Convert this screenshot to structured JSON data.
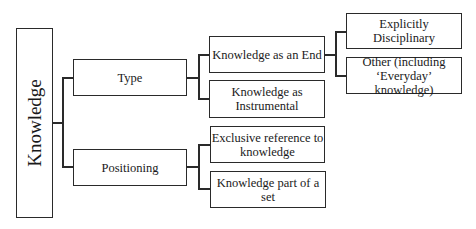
{
  "diagram": {
    "root": {
      "label": "Knowledge"
    },
    "level1": [
      {
        "label": "Type"
      },
      {
        "label": "Positioning"
      }
    ],
    "level2": [
      {
        "label": "Knowledge as an End",
        "parent": "Type"
      },
      {
        "label": "Knowledge as Instrumental",
        "line1": "Knowledge as",
        "line2": "Instrumental",
        "parent": "Type"
      },
      {
        "label": "Exclusive reference to knowledge",
        "line1": "Exclusive reference to",
        "line2": "knowledge",
        "parent": "Positioning"
      },
      {
        "label": "Knowledge part of a set",
        "parent": "Positioning"
      }
    ],
    "level3": [
      {
        "label": "Explicitly Disciplinary",
        "parent": "Knowledge as an End"
      },
      {
        "label": "Other (including ‘Everyday’ knowledge)",
        "line1": "Other (including",
        "line2": "‘Everyday’ knowledge)",
        "parent": "Knowledge as an End"
      }
    ]
  }
}
